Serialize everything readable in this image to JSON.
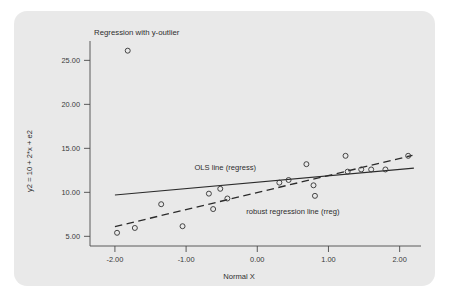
{
  "figure": {
    "background_color": "#e9e9e9",
    "page_color": "#ffffff",
    "marker_color": "#3b3b3b",
    "line_color": "#2b2b2b"
  },
  "chart_data": {
    "type": "scatter",
    "title": "Regression with y-outlier",
    "xlabel": "Normal X",
    "ylabel": "y2 = 10 + 2*x + e2",
    "xlim": [
      -2.35,
      2.3
    ],
    "ylim": [
      3.9,
      27.2
    ],
    "xticks": [
      -2,
      -1,
      0,
      1,
      2
    ],
    "xtick_labels": [
      "-2.00",
      "-1.00",
      "0.00",
      "1.00",
      "2.00"
    ],
    "yticks": [
      5,
      10,
      15,
      20,
      25
    ],
    "ytick_labels": [
      "5.00",
      "10.00",
      "15.00",
      "20.00",
      "25.00"
    ],
    "grid": false,
    "legend": "none",
    "marker": "open-circle",
    "points": [
      {
        "x": -1.97,
        "y": 5.4
      },
      {
        "x": -1.82,
        "y": 26.1
      },
      {
        "x": -1.72,
        "y": 5.95
      },
      {
        "x": -1.35,
        "y": 8.65
      },
      {
        "x": -1.05,
        "y": 6.15
      },
      {
        "x": -0.68,
        "y": 9.85
      },
      {
        "x": -0.62,
        "y": 8.1
      },
      {
        "x": -0.52,
        "y": 10.4
      },
      {
        "x": -0.42,
        "y": 9.3
      },
      {
        "x": 0.31,
        "y": 11.1
      },
      {
        "x": 0.44,
        "y": 11.4
      },
      {
        "x": 0.69,
        "y": 13.2
      },
      {
        "x": 0.79,
        "y": 10.8
      },
      {
        "x": 0.81,
        "y": 9.6
      },
      {
        "x": 1.24,
        "y": 14.15
      },
      {
        "x": 1.27,
        "y": 12.35
      },
      {
        "x": 1.46,
        "y": 12.6
      },
      {
        "x": 1.6,
        "y": 12.6
      },
      {
        "x": 1.8,
        "y": 12.6
      },
      {
        "x": 2.12,
        "y": 14.15
      }
    ],
    "lines": [
      {
        "name": "OLS line (regress)",
        "style": "solid",
        "label": "OLS line (regress)",
        "x_start": -2.0,
        "y_start": 9.7,
        "x_end": 2.2,
        "y_end": 12.75
      },
      {
        "name": "robust regression line (rreg)",
        "style": "dashed",
        "label": "robust regression line (rreg)",
        "x_start": -2.0,
        "y_start": 6.1,
        "x_end": 2.18,
        "y_end": 14.2
      }
    ],
    "annotations": [
      {
        "text": "OLS line (regress)",
        "x": -0.45,
        "y": 12.55
      },
      {
        "text": "robust regression line (rreg)",
        "x": 0.5,
        "y": 7.55
      }
    ]
  }
}
